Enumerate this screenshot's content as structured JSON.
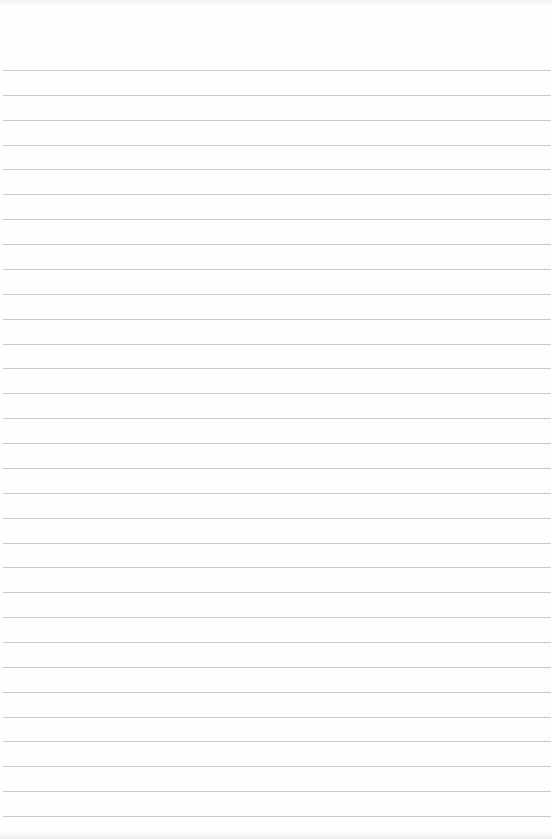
{
  "sheet": {
    "type": "lined-paper",
    "line_count": 31,
    "first_line_y": 70,
    "line_spacing": 24.87,
    "line_color": "#c9c9c9",
    "background_color": "#fefefe"
  }
}
